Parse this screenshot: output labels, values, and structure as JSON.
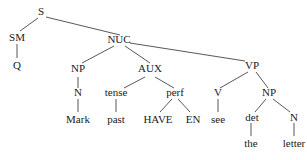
{
  "tree": {
    "nodes": {
      "S": "S",
      "SM": "SM",
      "Q": "Q",
      "NUC": "NUC",
      "NP1": "NP",
      "N1": "N",
      "Mark": "Mark",
      "AUX": "AUX",
      "tense": "tense",
      "past": "past",
      "perf": "perf",
      "HAVE": "HAVE",
      "EN": "EN",
      "VP": "VP",
      "V": "V",
      "see": "see",
      "NP2": "NP",
      "det": "det",
      "the": "the",
      "N2": "N",
      "letter": "letter"
    },
    "edges": [
      [
        "S",
        "SM"
      ],
      [
        "S",
        "NUC"
      ],
      [
        "SM",
        "Q"
      ],
      [
        "NUC",
        "NP1"
      ],
      [
        "NUC",
        "AUX"
      ],
      [
        "NUC",
        "VP"
      ],
      [
        "NP1",
        "N1"
      ],
      [
        "N1",
        "Mark"
      ],
      [
        "AUX",
        "tense"
      ],
      [
        "AUX",
        "perf"
      ],
      [
        "tense",
        "past"
      ],
      [
        "perf",
        "HAVE"
      ],
      [
        "perf",
        "EN"
      ],
      [
        "VP",
        "V"
      ],
      [
        "VP",
        "NP2"
      ],
      [
        "V",
        "see"
      ],
      [
        "NP2",
        "det"
      ],
      [
        "NP2",
        "N2"
      ],
      [
        "det",
        "the"
      ],
      [
        "N2",
        "letter"
      ]
    ]
  }
}
